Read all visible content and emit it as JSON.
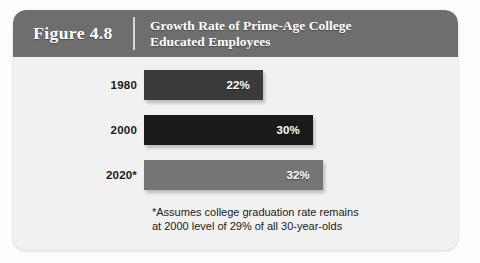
{
  "figure": {
    "number_label": "Figure 4.8",
    "title_line1": "Growth Rate of Prime-Age College",
    "title_line2": "Educated Employees",
    "footnote_line1": "*Assumes college graduation rate remains",
    "footnote_line2": "at 2000 level of 29% of all 30-year-olds"
  },
  "colors": {
    "header_bg": "#6e6e6e",
    "card_bg": "#f1f1f1",
    "page_bg": "#fdfdfd",
    "bar_1980": "#3a3a3a",
    "bar_2000": "#1a1a1a",
    "bar_2020": "#757575",
    "value_text": "#ffffff",
    "label_text": "#1b1b1b"
  },
  "chart_data": {
    "type": "bar",
    "orientation": "horizontal",
    "title": "Growth Rate of Prime-Age College Educated Employees",
    "xlabel": "",
    "ylabel": "",
    "grid": false,
    "legend": false,
    "categories": [
      "1980",
      "2000",
      "2020*"
    ],
    "values": [
      22,
      30,
      32
    ],
    "value_labels": [
      "22%",
      "30%",
      "32%"
    ],
    "unit": "percent",
    "xlim": [
      0,
      32
    ],
    "bars": [
      {
        "category": "1980",
        "value": 22,
        "label": "22%",
        "color": "#3a3a3a",
        "width_px": 119
      },
      {
        "category": "2000",
        "value": 30,
        "label": "30%",
        "color": "#1a1a1a",
        "width_px": 169
      },
      {
        "category": "2020*",
        "value": 32,
        "label": "32%",
        "color": "#757575",
        "width_px": 179
      }
    ],
    "annotations": [
      "*Assumes college graduation rate remains at 2000 level of 29% of all 30-year-olds"
    ]
  }
}
